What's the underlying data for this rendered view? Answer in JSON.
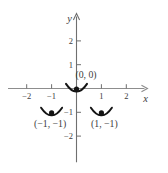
{
  "figure": {
    "colors": {
      "background": "#ffffff",
      "axis": "#8d8d8d",
      "tick": "#6f6f6f",
      "text": "#3d3d3d",
      "marker": "#141414"
    }
  },
  "chart_data": {
    "type": "scatter",
    "title": "",
    "xlabel": "x",
    "ylabel": "y",
    "xlim": [
      -2.75,
      2.85
    ],
    "ylim": [
      -3.1,
      3.15
    ],
    "grid": false,
    "legend": false,
    "x_ticks": [
      {
        "value": -2,
        "label": "−2"
      },
      {
        "value": -1,
        "label": "−1"
      },
      {
        "value": 1,
        "label": "1"
      },
      {
        "value": 2,
        "label": "2"
      }
    ],
    "y_ticks": [
      {
        "value": -2,
        "label": "−2"
      },
      {
        "value": -1,
        "label": "−1"
      },
      {
        "value": 1,
        "label": "1"
      },
      {
        "value": 2,
        "label": "2"
      }
    ],
    "points": [
      {
        "x": 0,
        "y": 0,
        "label": "(0, 0)",
        "label_position": "above-right",
        "marker": "dot-with-concave-arc"
      },
      {
        "x": -1,
        "y": -1,
        "label": "(−1, −1)",
        "label_position": "below",
        "marker": "dot-with-concave-arc"
      },
      {
        "x": 1,
        "y": -1,
        "label": "(1, −1)",
        "label_position": "below",
        "marker": "dot-with-concave-arc"
      }
    ]
  }
}
